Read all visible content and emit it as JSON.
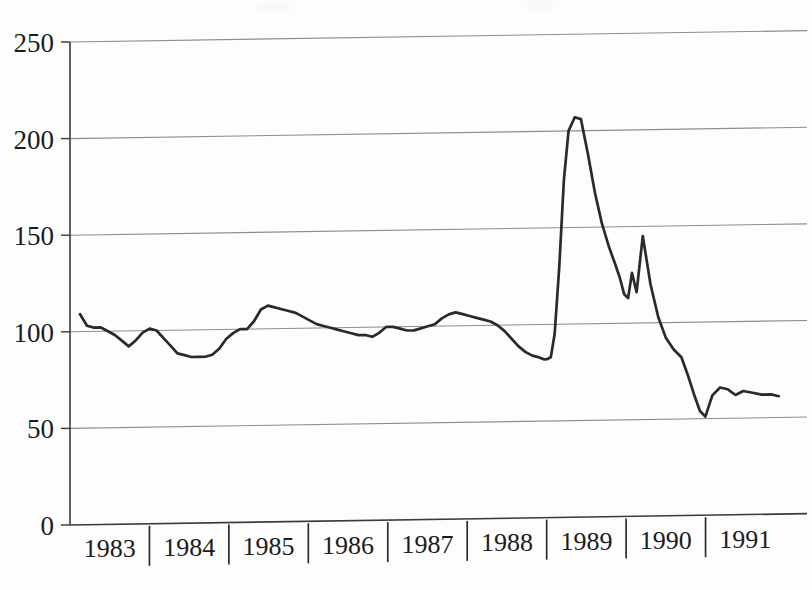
{
  "chart_data": {
    "type": "line",
    "title": "",
    "subtitle": "",
    "xlabel": "",
    "ylabel": "",
    "xlim": [
      1982.75,
      1992.0
    ],
    "ylim": [
      0,
      250
    ],
    "yticks": [
      0,
      50,
      100,
      150,
      200,
      250
    ],
    "ytick_labels": [
      "0",
      "50",
      "100",
      "150",
      "200",
      "250"
    ],
    "xtick_labels": [
      "1983",
      "1984",
      "1985",
      "1986",
      "1987",
      "1988",
      "1989",
      "1990",
      "1991"
    ],
    "grid": "horizontal",
    "legend": "none",
    "series": [
      {
        "name": "index",
        "color": "#2a2a2a",
        "x": [
          1982.88,
          1982.97,
          1983.06,
          1983.15,
          1983.24,
          1983.33,
          1983.42,
          1983.51,
          1983.6,
          1983.69,
          1983.78,
          1983.87,
          1983.96,
          1984.05,
          1984.14,
          1984.23,
          1984.32,
          1984.41,
          1984.5,
          1984.59,
          1984.68,
          1984.77,
          1984.86,
          1984.95,
          1985.04,
          1985.13,
          1985.22,
          1985.31,
          1985.4,
          1985.49,
          1985.58,
          1985.67,
          1985.76,
          1985.85,
          1985.94,
          1986.03,
          1986.12,
          1986.21,
          1986.3,
          1986.39,
          1986.48,
          1986.57,
          1986.66,
          1986.75,
          1986.84,
          1986.93,
          1987.02,
          1987.11,
          1987.2,
          1987.29,
          1987.38,
          1987.47,
          1987.56,
          1987.65,
          1987.74,
          1987.83,
          1987.92,
          1988.01,
          1988.1,
          1988.19,
          1988.28,
          1988.37,
          1988.46,
          1988.55,
          1988.64,
          1988.73,
          1988.82,
          1988.88,
          1988.92,
          1988.97,
          1989.02,
          1989.08,
          1989.14,
          1989.2,
          1989.28,
          1989.36,
          1989.45,
          1989.54,
          1989.63,
          1989.72,
          1989.8,
          1989.86,
          1989.92,
          1989.97,
          1990.02,
          1990.08,
          1990.16,
          1990.26,
          1990.36,
          1990.46,
          1990.56,
          1990.66,
          1990.74,
          1990.82,
          1990.9,
          1990.97,
          1991.06,
          1991.16,
          1991.26,
          1991.36,
          1991.46,
          1991.58,
          1991.7,
          1991.82,
          1991.92
        ],
        "y": [
          109,
          103,
          102,
          102,
          100,
          98,
          95,
          92,
          95,
          99,
          101,
          100,
          96,
          92,
          88,
          87,
          86,
          86,
          86,
          87,
          90,
          95,
          98,
          100,
          100,
          104,
          110,
          112,
          111,
          110,
          109,
          108,
          106,
          104,
          102,
          101,
          100,
          99,
          98,
          97,
          96,
          96,
          95,
          97,
          100,
          100,
          99,
          98,
          98,
          99,
          100,
          101,
          104,
          106,
          107,
          106,
          105,
          104,
          103,
          102,
          100,
          97,
          93,
          89,
          86,
          84,
          83,
          82,
          82,
          83,
          95,
          130,
          175,
          200,
          207,
          206,
          188,
          168,
          152,
          140,
          131,
          124,
          115,
          113,
          126,
          116,
          145,
          120,
          103,
          92,
          86,
          82,
          73,
          63,
          54,
          51,
          62,
          66,
          65,
          62,
          64,
          63,
          62,
          62,
          61
        ]
      }
    ]
  },
  "axes": {
    "y_axis_name": "value-axis",
    "x_axis_name": "year-axis"
  }
}
